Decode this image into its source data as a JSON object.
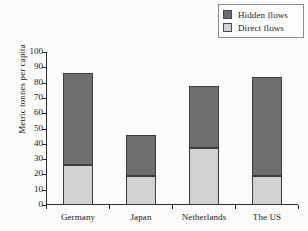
{
  "chart_data": {
    "type": "bar",
    "title": "",
    "subtitle": "",
    "xlabel": "",
    "ylabel": "Metric tonnes per capita",
    "categories": [
      "Germany",
      "Japan",
      "Netherlands",
      "The US"
    ],
    "series": [
      {
        "name": "Direct flows",
        "color": "#d2d2d2",
        "values": [
          26,
          19,
          37.5,
          19
        ]
      },
      {
        "name": "Hidden flows",
        "color": "#6e6e6e",
        "values": [
          60,
          26.5,
          40.5,
          65
        ]
      }
    ],
    "totals": [
      86,
      45.5,
      78,
      84
    ],
    "stacked": true,
    "ylim": [
      0,
      100
    ],
    "yticks": [
      0,
      10,
      20,
      30,
      40,
      50,
      60,
      70,
      80,
      90,
      100
    ],
    "ytick_labels": [
      "0",
      "10",
      "20",
      "30",
      "40",
      "50",
      "60",
      "70",
      "80",
      "90",
      "100"
    ],
    "grid": false,
    "legend_position": "top-right",
    "legend_entries": [
      "Hidden flows",
      "Direct flows"
    ]
  },
  "legend": {
    "entries": [
      {
        "label": "Hidden flows",
        "color": "#6e6e6e"
      },
      {
        "label": "Direct flows",
        "color": "#d2d2d2"
      }
    ]
  },
  "axes": {
    "y_title": "Metric tonnes per capita"
  },
  "colors": {
    "hidden_flows": "#6e6e6e",
    "direct_flows": "#d2d2d2",
    "axis": "#2b2b2b",
    "background": "#fbfbfa"
  }
}
